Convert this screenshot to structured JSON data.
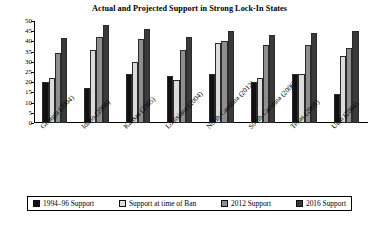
{
  "chart_data": {
    "type": "bar",
    "title": "Actual and Projected Support in Strong Lock-In States",
    "xlabel": "",
    "ylabel": "",
    "ylim": [
      0,
      50
    ],
    "yticks": [
      0,
      5,
      10,
      15,
      20,
      25,
      30,
      35,
      40,
      45,
      50
    ],
    "grid": false,
    "legend_position": "bottom",
    "categories": [
      "Georgia (2004)",
      "Idaho (2006)",
      "Kansas (2005)",
      "Louisiana (2004)",
      "North Carolina (2012)",
      "South Carolina (2006)",
      "Texas (2005)",
      "Utah (2004)"
    ],
    "series": [
      {
        "name": "1994–96 Support",
        "color": "#111111",
        "values": [
          20,
          17,
          24,
          23,
          24,
          20,
          24,
          14
        ]
      },
      {
        "name": "Support at time of Ban",
        "color": "#dcdcdc",
        "values": [
          22,
          36,
          30,
          21,
          39,
          22,
          24,
          33
        ]
      },
      {
        "name": "2012 Support",
        "color": "#8e8e8e",
        "values": [
          34.5,
          42,
          41,
          36,
          40,
          38,
          38,
          37
        ]
      },
      {
        "name": "2016 Support",
        "color": "#3a3a3a",
        "values": [
          41.5,
          48,
          46,
          42,
          45,
          43,
          44,
          45
        ]
      }
    ]
  },
  "legend": {
    "items": [
      "1994–96 Support",
      "Support at time of Ban",
      "2012 Support",
      "2016 Support"
    ]
  }
}
